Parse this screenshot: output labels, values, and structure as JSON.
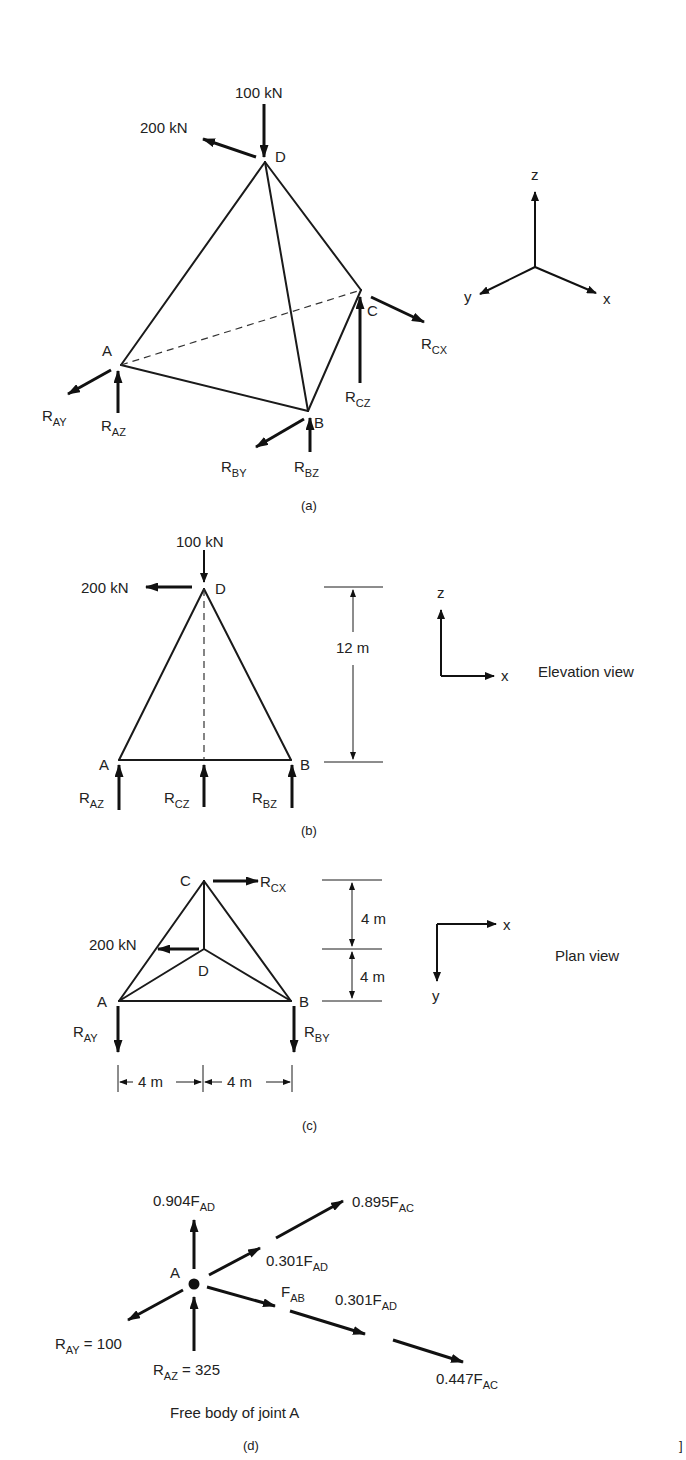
{
  "figure_a": {
    "caption": "(a)",
    "loads": {
      "vertical": "100 kN",
      "horizontal": "200 kN"
    },
    "nodes": {
      "A": "A",
      "B": "B",
      "C": "C",
      "D": "D"
    },
    "reactions": {
      "RAY": {
        "main": "R",
        "sub": "AY"
      },
      "RAZ": {
        "main": "R",
        "sub": "AZ"
      },
      "RBY": {
        "main": "R",
        "sub": "BY"
      },
      "RBZ": {
        "main": "R",
        "sub": "BZ"
      },
      "RCZ": {
        "main": "R",
        "sub": "CZ"
      },
      "RCX": {
        "main": "R",
        "sub": "CX"
      }
    },
    "axes": {
      "x": "x",
      "y": "y",
      "z": "z"
    }
  },
  "figure_b": {
    "caption": "(b)",
    "view_label": "Elevation view",
    "loads": {
      "vertical": "100 kN",
      "horizontal": "200 kN"
    },
    "nodes": {
      "A": "A",
      "B": "B",
      "D": "D"
    },
    "dimension": "12 m",
    "reactions": {
      "RAZ": {
        "main": "R",
        "sub": "AZ"
      },
      "RCZ": {
        "main": "R",
        "sub": "CZ"
      },
      "RBZ": {
        "main": "R",
        "sub": "BZ"
      }
    },
    "axes": {
      "x": "x",
      "z": "z"
    }
  },
  "figure_c": {
    "caption": "(c)",
    "view_label": "Plan view",
    "load": "200 kN",
    "nodes": {
      "A": "A",
      "B": "B",
      "C": "C",
      "D": "D"
    },
    "dimensions": {
      "upper": "4 m",
      "lower": "4 m",
      "left": "4 m",
      "right": "4 m"
    },
    "reactions": {
      "RCX": {
        "main": "R",
        "sub": "CX"
      },
      "RAY": {
        "main": "R",
        "sub": "AY"
      },
      "RBY": {
        "main": "R",
        "sub": "BY"
      }
    },
    "axes": {
      "x": "x",
      "y": "y"
    }
  },
  "figure_d": {
    "caption": "(d)",
    "title": "Free body of joint A",
    "node": "A",
    "forces": {
      "f1": {
        "main": "0.904F",
        "sub": "AD"
      },
      "f2": {
        "main": "0.895F",
        "sub": "AC"
      },
      "f3": {
        "main": "0.301F",
        "sub": "AD"
      },
      "f4": {
        "main": "F",
        "sub": "AB"
      },
      "f5": {
        "main": "0.301F",
        "sub": "AD"
      },
      "f6": {
        "main": "0.447F",
        "sub": "AC"
      },
      "ray": {
        "main": "R",
        "sub": "AY",
        "value": " = 100"
      },
      "raz": {
        "main": "R",
        "sub": "AZ",
        "value": " = 325"
      }
    }
  },
  "margin_mark": "]"
}
